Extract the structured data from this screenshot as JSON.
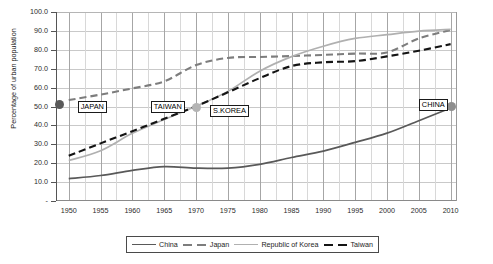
{
  "chart_data": {
    "type": "line",
    "title": "",
    "xlabel": "",
    "ylabel": "Percentage of urban population",
    "xlim": [
      1948,
      2011
    ],
    "ylim": [
      0,
      100
    ],
    "grid": true,
    "legend_position": "bottom",
    "x_ticks": [
      "1950",
      "1955",
      "1960",
      "1965",
      "1970",
      "1975",
      "1980",
      "1985",
      "1990",
      "1995",
      "2000",
      "2005",
      "2010"
    ],
    "y_ticks": [
      "100.0",
      "90.0",
      "80.0",
      "70.0",
      "60.0",
      "50.0",
      "40.0",
      "30.0",
      "20.0",
      "10.0",
      "-"
    ],
    "series": [
      {
        "name": "China",
        "style": "solid",
        "color": "#595959",
        "x": [
          1950,
          1955,
          1960,
          1965,
          1970,
          1975,
          1980,
          1985,
          1990,
          1995,
          2000,
          2005,
          2010
        ],
        "values": [
          11.8,
          13.5,
          16.2,
          18.2,
          17.4,
          17.4,
          19.4,
          23.0,
          26.4,
          31.0,
          35.9,
          42.5,
          49.2
        ]
      },
      {
        "name": "Japan",
        "style": "dashed",
        "color": "#7d7d7d",
        "x": [
          1950,
          1955,
          1960,
          1965,
          1970,
          1975,
          1980,
          1985,
          1990,
          1995,
          2000,
          2005,
          2010
        ],
        "values": [
          53.4,
          56.3,
          59.6,
          63.3,
          71.9,
          75.7,
          76.2,
          76.7,
          77.3,
          78.0,
          78.6,
          86.0,
          90.5
        ]
      },
      {
        "name": "Republic of Korea",
        "style": "solid",
        "color": "#b0b0b0",
        "x": [
          1950,
          1955,
          1960,
          1965,
          1970,
          1975,
          1980,
          1985,
          1990,
          1995,
          2000,
          2005,
          2010
        ],
        "values": [
          21.4,
          26.6,
          35.8,
          43.1,
          50.1,
          58.0,
          68.7,
          76.4,
          81.9,
          86.0,
          88.0,
          89.9,
          90.8
        ]
      },
      {
        "name": "Taiwan",
        "style": "dashed",
        "color": "#141414",
        "x": [
          1950,
          1955,
          1960,
          1965,
          1970,
          1975,
          1980,
          1985,
          1990,
          1995,
          2000,
          2005,
          2010
        ],
        "values": [
          23.9,
          30.5,
          36.9,
          43.5,
          50.1,
          57.5,
          65.0,
          71.4,
          73.4,
          74.0,
          76.5,
          79.5,
          83.0
        ]
      }
    ],
    "annotations": [
      {
        "label": "JAPAN",
        "x": 1951.4,
        "y": 50.0,
        "marker_x": 1948.6,
        "marker_y": 51.0,
        "marker_color": "#5a5a5a"
      },
      {
        "label": "TAIWAN",
        "x": 1962.9,
        "y": 50.0,
        "marker_x": 1966.4,
        "marker_y": 49.5,
        "marker_color": "#0d0d0d"
      },
      {
        "label": "S.KOREA",
        "x": 1972.2,
        "y": 47.7,
        "marker_x": 1970.1,
        "marker_y": 49.6,
        "marker_color": "#b4b4b4"
      },
      {
        "label": "CHINA",
        "x": 2005.0,
        "y": 50.9,
        "marker_x": 2010.2,
        "marker_y": 50.0,
        "marker_color": "#8e8e8e"
      }
    ]
  },
  "legend": {
    "items": [
      {
        "label": "China",
        "color": "#595959",
        "style": "solid"
      },
      {
        "label": "Japan",
        "color": "#7d7d7d",
        "style": "dashed"
      },
      {
        "label": "Republic of Korea",
        "color": "#b0b0b0",
        "style": "solid"
      },
      {
        "label": "Taiwan",
        "color": "#141414",
        "style": "dashed"
      }
    ]
  }
}
